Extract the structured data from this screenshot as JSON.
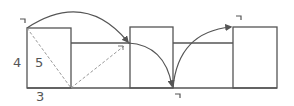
{
  "diagram": {
    "type": "rolling-box",
    "colors": {
      "line": "#555555",
      "dashed": "#999999",
      "background": "#ffffff"
    },
    "labels": {
      "height": "4",
      "diagonal": "5",
      "width": "3",
      "corner_mark": "ㄱ"
    },
    "boxes": [
      {
        "id": "box-1",
        "x": 27,
        "y": 28,
        "w": 44,
        "h": 60
      },
      {
        "id": "box-2",
        "x": 130,
        "y": 27,
        "w": 43,
        "h": 61
      },
      {
        "id": "box-3",
        "x": 233,
        "y": 27,
        "w": 44,
        "h": 61
      }
    ],
    "corner_marks": [
      {
        "id": "mark-start",
        "x": 20,
        "y": 18
      },
      {
        "id": "mark-after-first-roll",
        "x": 118,
        "y": 45
      },
      {
        "id": "mark-bottom",
        "x": 174,
        "y": 93
      },
      {
        "id": "mark-end",
        "x": 236,
        "y": 15
      }
    ]
  }
}
